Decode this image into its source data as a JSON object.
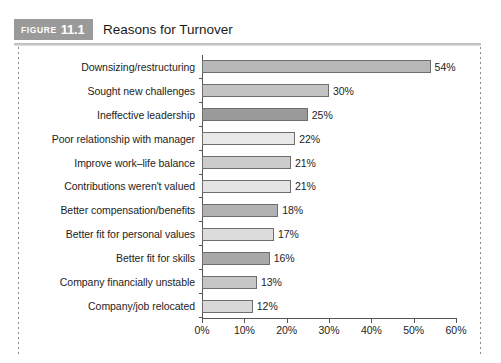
{
  "figure": {
    "badge_word": "FIGURE",
    "badge_number": "11.1",
    "title": "Reasons for Turnover",
    "badge_color": "#9a9a9a",
    "rule_color": "#c2c2c2"
  },
  "chart_data": {
    "type": "bar",
    "orientation": "horizontal",
    "title": "Reasons for Turnover",
    "xlabel": "",
    "ylabel": "",
    "xlim": [
      0,
      60
    ],
    "xticks": [
      "0%",
      "10%",
      "20%",
      "30%",
      "40%",
      "50%",
      "60%"
    ],
    "xtick_values": [
      0,
      10,
      20,
      30,
      40,
      50,
      60
    ],
    "grid": false,
    "legend": "none",
    "categories": [
      "Downsizing/restructuring",
      "Sought new challenges",
      "Ineffective leadership",
      "Poor relationship with manager",
      "Improve work–life balance",
      "Contributions weren't valued",
      "Better compensation/benefits",
      "Better fit for personal values",
      "Better fit for skills",
      "Company financially unstable",
      "Company/job relocated"
    ],
    "values": [
      54,
      30,
      25,
      22,
      21,
      21,
      18,
      17,
      16,
      13,
      12
    ],
    "value_labels": [
      "54%",
      "30%",
      "25%",
      "22%",
      "21%",
      "21%",
      "18%",
      "17%",
      "16%",
      "13%",
      "12%"
    ],
    "bar_colors": [
      "#b8b8b8",
      "#c4c4c4",
      "#9a9a9a",
      "#e8e8e8",
      "#cccccc",
      "#e4e4e4",
      "#b2b2b2",
      "#dcdcdc",
      "#a8a8a8",
      "#c6c6c6",
      "#d8d8d8"
    ],
    "bar_border_color": "#6e6e6e",
    "axis_color": "#555555"
  }
}
